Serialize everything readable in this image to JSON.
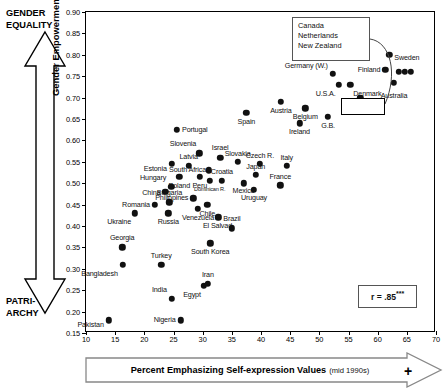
{
  "chart_data": {
    "type": "scatter",
    "title": "",
    "xlabel": "Percent Emphasizing Self-expression Values",
    "xlabel_sub": "(mid 1990s)",
    "ylabel": "Gender Empowerment Index (2000)",
    "xlim": [
      10,
      70
    ],
    "ylim": [
      0.15,
      0.9
    ],
    "xticks": [
      10,
      15,
      20,
      25,
      30,
      35,
      40,
      45,
      50,
      55,
      60,
      65,
      70
    ],
    "yticks": [
      "0.90",
      "0.85",
      "0.80",
      "0.75",
      "0.70",
      "0.65",
      "0.60",
      "0.55",
      "0.50",
      "0.45",
      "0.40",
      "0.35",
      "0.30",
      "0.25",
      "0.20",
      "0.15"
    ],
    "grid": false,
    "legend": "none",
    "annotation_top_label": "GENDER EQUALITY",
    "annotation_bottom_label": "PATRI- ARCHY",
    "correlation_label": "r = .85",
    "correlation_stars": "***",
    "points": [
      {
        "name": "Pakistan",
        "x": 13.9,
        "y": 0.18,
        "lx": -5,
        "ly": 5,
        "align": "r"
      },
      {
        "name": "Nigeria",
        "x": 26.2,
        "y": 0.18,
        "lx": -5,
        "ly": 0,
        "align": "r"
      },
      {
        "name": "India",
        "x": 24.7,
        "y": 0.23,
        "lx": -5,
        "ly": -9,
        "align": "r"
      },
      {
        "name": "Egypt",
        "x": 30.2,
        "y": 0.26,
        "lx": -3,
        "ly": 9,
        "align": "r"
      },
      {
        "name": "Iran",
        "x": 30.9,
        "y": 0.265,
        "lx": 0,
        "ly": -9,
        "align": "c"
      },
      {
        "name": "Bangladesh",
        "x": 16.3,
        "y": 0.31,
        "lx": -5,
        "ly": 9,
        "align": "r"
      },
      {
        "name": "Turkey",
        "x": 22.9,
        "y": 0.31,
        "lx": 0,
        "ly": -9,
        "align": "c"
      },
      {
        "name": "Georgia",
        "x": 16.2,
        "y": 0.35,
        "lx": 0,
        "ly": -9,
        "align": "c"
      },
      {
        "name": "South Korea",
        "x": 31.3,
        "y": 0.36,
        "lx": 0,
        "ly": 9,
        "align": "c"
      },
      {
        "name": "Brazil",
        "x": 35.0,
        "y": 0.395,
        "lx": 0,
        "ly": -9,
        "align": "c"
      },
      {
        "name": "Ukraine",
        "x": 18.4,
        "y": 0.43,
        "lx": -4,
        "ly": 9,
        "align": "r"
      },
      {
        "name": "Russia",
        "x": 24.1,
        "y": 0.43,
        "lx": 0,
        "ly": 9,
        "align": "c"
      },
      {
        "name": "Romania",
        "x": 21.8,
        "y": 0.45,
        "lx": -5,
        "ly": 0,
        "align": "r"
      },
      {
        "name": "Bulgaria",
        "x": 24.3,
        "y": 0.455,
        "lx": 0,
        "ly": -9,
        "align": "c"
      },
      {
        "name": "Venezuela",
        "x": 29.2,
        "y": 0.44,
        "lx": 0,
        "ly": 9,
        "align": "c"
      },
      {
        "name": "El Salvad.",
        "x": 32.7,
        "y": 0.42,
        "lx": 0,
        "ly": 9,
        "align": "c"
      },
      {
        "name": "Philippines",
        "x": 28.4,
        "y": 0.465,
        "lx": -5,
        "ly": 0,
        "align": "r"
      },
      {
        "name": "Chile",
        "x": 30.8,
        "y": 0.45,
        "lx": 0,
        "ly": 9,
        "align": "c"
      },
      {
        "name": "China",
        "x": 23.6,
        "y": 0.48,
        "lx": -5,
        "ly": 1,
        "align": "r"
      },
      {
        "name": "Hungary",
        "x": 24.6,
        "y": 0.492,
        "lx": -5,
        "ly": -9,
        "align": "r"
      },
      {
        "name": "Poland",
        "x": 26.0,
        "y": 0.515,
        "lx": 0,
        "ly": 9,
        "align": "c"
      },
      {
        "name": "Peru",
        "x": 29.5,
        "y": 0.515,
        "lx": 0,
        "ly": 9,
        "align": "c"
      },
      {
        "name": "Dominican R.",
        "x": 31.2,
        "y": 0.505,
        "lx": 0,
        "ly": 9,
        "align": "c",
        "tiny": true
      },
      {
        "name": "Estonia",
        "x": 24.7,
        "y": 0.545,
        "lx": -5,
        "ly": 5,
        "align": "r"
      },
      {
        "name": "Latvia",
        "x": 27.6,
        "y": 0.54,
        "lx": 0,
        "ly": -9,
        "align": "c"
      },
      {
        "name": "Croatia",
        "x": 33.3,
        "y": 0.505,
        "lx": 0,
        "ly": -9,
        "align": "c"
      },
      {
        "name": "South Africa",
        "x": 31.1,
        "y": 0.53,
        "lx": -3,
        "ly": 0,
        "align": "r"
      },
      {
        "name": "Slovenia",
        "x": 29.4,
        "y": 0.57,
        "lx": -3,
        "ly": -9,
        "align": "r"
      },
      {
        "name": "Israel",
        "x": 33.0,
        "y": 0.56,
        "lx": 0,
        "ly": -10,
        "align": "c"
      },
      {
        "name": "Slovakia",
        "x": 36.0,
        "y": 0.55,
        "lx": 0,
        "ly": -8,
        "align": "c"
      },
      {
        "name": "Czech R.",
        "x": 39.8,
        "y": 0.545,
        "lx": 0,
        "ly": -8,
        "align": "c"
      },
      {
        "name": "Italy",
        "x": 44.4,
        "y": 0.54,
        "lx": 0,
        "ly": -8,
        "align": "c"
      },
      {
        "name": "Japan",
        "x": 39.1,
        "y": 0.52,
        "lx": 0,
        "ly": -8,
        "align": "c"
      },
      {
        "name": "Mexico",
        "x": 37.0,
        "y": 0.5,
        "lx": 0,
        "ly": 8,
        "align": "c"
      },
      {
        "name": "Uruguay",
        "x": 38.8,
        "y": 0.485,
        "lx": 0,
        "ly": 8,
        "align": "c"
      },
      {
        "name": "France",
        "x": 43.3,
        "y": 0.495,
        "lx": 0,
        "ly": -8,
        "align": "c"
      },
      {
        "name": "Portugal",
        "x": 25.6,
        "y": 0.625,
        "lx": 5,
        "ly": 0,
        "align": "l"
      },
      {
        "name": "Spain",
        "x": 37.5,
        "y": 0.665,
        "lx": 0,
        "ly": 9,
        "align": "c"
      },
      {
        "name": "Austria",
        "x": 43.4,
        "y": 0.69,
        "lx": 0,
        "ly": 9,
        "align": "c"
      },
      {
        "name": "Ireland",
        "x": 46.6,
        "y": 0.64,
        "lx": 0,
        "ly": 9,
        "align": "c"
      },
      {
        "name": "Belgium",
        "x": 47.6,
        "y": 0.675,
        "lx": 0,
        "ly": 9,
        "align": "c"
      },
      {
        "name": "G.B.",
        "x": 51.5,
        "y": 0.655,
        "lx": 0,
        "ly": 9,
        "align": "c"
      },
      {
        "name": "Germany (W.)",
        "x": 52.3,
        "y": 0.755,
        "lx": -5,
        "ly": -8,
        "align": "r"
      },
      {
        "name": "U.S.A.",
        "x": 53.3,
        "y": 0.73,
        "lx": -3,
        "ly": 9,
        "align": "r"
      },
      {
        "name": "Denmark",
        "x": 55.3,
        "y": 0.73,
        "lx": 3,
        "ly": 9,
        "align": "l"
      },
      {
        "name": "Switzerld.",
        "x": 57.0,
        "y": 0.7,
        "lx": 0,
        "ly": 9,
        "align": "c"
      },
      {
        "name": "Iceland",
        "x": 55.7,
        "y": 0.825,
        "lx": -4,
        "ly": 9,
        "align": "r"
      },
      {
        "name": "Norway",
        "x": 56.2,
        "y": 0.855,
        "lx": -4,
        "ly": -1,
        "align": "r"
      },
      {
        "name": "Finland",
        "x": 61.3,
        "y": 0.765,
        "lx": -5,
        "ly": 0,
        "align": "r"
      },
      {
        "name": "Sweden",
        "x": 62.0,
        "y": 0.8,
        "lx": 5,
        "ly": 3,
        "align": "l"
      },
      {
        "name": "Australia",
        "x": 62.8,
        "y": 0.735,
        "lx": 0,
        "ly": 13,
        "align": "c"
      }
    ],
    "callout": {
      "labels": [
        "Canada",
        "Netherlands",
        "New Zealand"
      ],
      "grouped_points": [
        {
          "x": 63.6,
          "y": 0.76
        },
        {
          "x": 64.7,
          "y": 0.76
        },
        {
          "x": 65.7,
          "y": 0.76
        }
      ]
    }
  },
  "axes": {
    "y_top_annotation_line1": "GENDER",
    "y_top_annotation_line2": "EQUALITY",
    "y_bottom_annotation_line1": "PATRI-",
    "y_bottom_annotation_line2": "ARCHY",
    "y_title": "Gender Empowerment Index (2000)",
    "x_title": "Percent Emphasizing Self-expression Values",
    "x_title_sub": "(mid 1990s)",
    "x_plus": "+"
  },
  "stats": {
    "r_label": "r = .85",
    "r_stars": "***"
  },
  "colors": {
    "point": "#111111",
    "frame": "#000000",
    "background": "#ffffff"
  }
}
